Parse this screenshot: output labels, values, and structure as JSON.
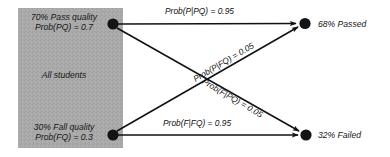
{
  "diagram": {
    "population_box": {
      "fill_color": "#a8a8a8",
      "center_label": "All students"
    },
    "source_nodes": [
      {
        "id": "pass-quality",
        "line1": "70% Pass quality",
        "line2": "Prob(PQ) = 0.7"
      },
      {
        "id": "fail-quality",
        "line1": "30% Fall quality",
        "line2": "Prob(FQ) = 0.3"
      }
    ],
    "target_nodes": [
      {
        "id": "passed",
        "label": "68% Passed"
      },
      {
        "id": "failed",
        "label": "32% Failed"
      }
    ],
    "edges": [
      {
        "id": "pq-to-p",
        "label": "Prob(P|PQ) = 0.95",
        "from": "pass-quality",
        "to": "passed",
        "value": 0.95
      },
      {
        "id": "fq-to-p",
        "label": "Prob(P|FQ) = 0.05",
        "from": "fail-quality",
        "to": "passed",
        "value": 0.05
      },
      {
        "id": "pq-to-f",
        "label": "Prob(F|PQ) = 0.05",
        "from": "pass-quality",
        "to": "failed",
        "value": 0.05
      },
      {
        "id": "fq-to-f",
        "label": "Prob(F|FQ) = 0.95",
        "from": "fail-quality",
        "to": "failed",
        "value": 0.95
      }
    ],
    "colors": {
      "node": "#141414",
      "arrow": "#111111",
      "background": "#ffffff"
    }
  }
}
